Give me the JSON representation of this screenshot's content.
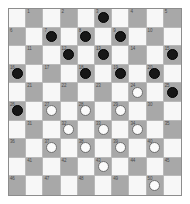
{
  "diagram": {
    "kind": "international-draughts-board",
    "board": {
      "rows": 10,
      "columns": 10,
      "numbered_squares": 50,
      "light_square_color": "#f7f7f7",
      "dark_square_color": "#a8a8a8",
      "grid_line_color": "#b9b9b9",
      "border_color": "#8d8d8d"
    },
    "pieces": {
      "black_color": "#171717",
      "white_color": "#fbfbfb",
      "black_count": 15,
      "white_count": 16,
      "black_squares": [
        3,
        7,
        8,
        9,
        13,
        12,
        15,
        16,
        19,
        18,
        20,
        25,
        26
      ],
      "white_squares": [
        24,
        27,
        28,
        29,
        32,
        33,
        34,
        37,
        38,
        39,
        40,
        43,
        50
      ]
    },
    "squares": [
      {
        "n": 1,
        "row": 1,
        "col": 2,
        "piece": ""
      },
      {
        "n": 2,
        "row": 1,
        "col": 4,
        "piece": ""
      },
      {
        "n": 3,
        "row": 1,
        "col": 6,
        "piece": "black"
      },
      {
        "n": 4,
        "row": 1,
        "col": 8,
        "piece": ""
      },
      {
        "n": 5,
        "row": 1,
        "col": 10,
        "piece": ""
      },
      {
        "n": 6,
        "row": 2,
        "col": 1,
        "piece": ""
      },
      {
        "n": 7,
        "row": 2,
        "col": 3,
        "piece": "black"
      },
      {
        "n": 8,
        "row": 2,
        "col": 5,
        "piece": "black"
      },
      {
        "n": 9,
        "row": 2,
        "col": 7,
        "piece": "black"
      },
      {
        "n": 10,
        "row": 2,
        "col": 9,
        "piece": ""
      },
      {
        "n": 11,
        "row": 3,
        "col": 2,
        "piece": ""
      },
      {
        "n": 12,
        "row": 3,
        "col": 4,
        "piece": "black"
      },
      {
        "n": 13,
        "row": 3,
        "col": 6,
        "piece": "black"
      },
      {
        "n": 14,
        "row": 3,
        "col": 8,
        "piece": ""
      },
      {
        "n": 15,
        "row": 3,
        "col": 10,
        "piece": "black"
      },
      {
        "n": 16,
        "row": 4,
        "col": 1,
        "piece": "black"
      },
      {
        "n": 17,
        "row": 4,
        "col": 3,
        "piece": ""
      },
      {
        "n": 18,
        "row": 4,
        "col": 5,
        "piece": "black"
      },
      {
        "n": 19,
        "row": 4,
        "col": 7,
        "piece": "black"
      },
      {
        "n": 20,
        "row": 4,
        "col": 9,
        "piece": "black"
      },
      {
        "n": 21,
        "row": 5,
        "col": 2,
        "piece": ""
      },
      {
        "n": 22,
        "row": 5,
        "col": 4,
        "piece": ""
      },
      {
        "n": 23,
        "row": 5,
        "col": 6,
        "piece": ""
      },
      {
        "n": 24,
        "row": 5,
        "col": 8,
        "piece": "white"
      },
      {
        "n": 25,
        "row": 5,
        "col": 10,
        "piece": "black"
      },
      {
        "n": 26,
        "row": 6,
        "col": 1,
        "piece": "black"
      },
      {
        "n": 27,
        "row": 6,
        "col": 3,
        "piece": "white"
      },
      {
        "n": 28,
        "row": 6,
        "col": 5,
        "piece": "white"
      },
      {
        "n": 29,
        "row": 6,
        "col": 7,
        "piece": "white"
      },
      {
        "n": 30,
        "row": 6,
        "col": 9,
        "piece": ""
      },
      {
        "n": 31,
        "row": 7,
        "col": 2,
        "piece": ""
      },
      {
        "n": 32,
        "row": 7,
        "col": 4,
        "piece": "white"
      },
      {
        "n": 33,
        "row": 7,
        "col": 6,
        "piece": "white"
      },
      {
        "n": 34,
        "row": 7,
        "col": 8,
        "piece": "white"
      },
      {
        "n": 35,
        "row": 7,
        "col": 10,
        "piece": ""
      },
      {
        "n": 36,
        "row": 8,
        "col": 1,
        "piece": ""
      },
      {
        "n": 37,
        "row": 8,
        "col": 3,
        "piece": "white"
      },
      {
        "n": 38,
        "row": 8,
        "col": 5,
        "piece": "white"
      },
      {
        "n": 39,
        "row": 8,
        "col": 7,
        "piece": "white"
      },
      {
        "n": 40,
        "row": 8,
        "col": 9,
        "piece": "white"
      },
      {
        "n": 41,
        "row": 9,
        "col": 2,
        "piece": ""
      },
      {
        "n": 42,
        "row": 9,
        "col": 4,
        "piece": ""
      },
      {
        "n": 43,
        "row": 9,
        "col": 6,
        "piece": "white"
      },
      {
        "n": 44,
        "row": 9,
        "col": 8,
        "piece": ""
      },
      {
        "n": 45,
        "row": 9,
        "col": 10,
        "piece": ""
      },
      {
        "n": 46,
        "row": 10,
        "col": 1,
        "piece": ""
      },
      {
        "n": 47,
        "row": 10,
        "col": 3,
        "piece": ""
      },
      {
        "n": 48,
        "row": 10,
        "col": 5,
        "piece": ""
      },
      {
        "n": 49,
        "row": 10,
        "col": 7,
        "piece": ""
      },
      {
        "n": 50,
        "row": 10,
        "col": 9,
        "piece": "white"
      }
    ]
  }
}
